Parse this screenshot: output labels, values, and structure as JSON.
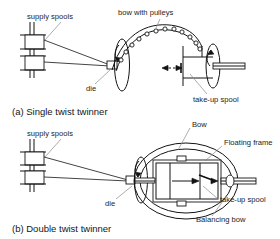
{
  "figure": {
    "panels": [
      {
        "id": "panel-a",
        "caption": "(a) Single twist twinner",
        "labels": {
          "supply_spools": "supply spools",
          "die": "die",
          "bow_with_pulleys": "bow with pulleys",
          "take_up_spool": "take-up spool"
        }
      },
      {
        "id": "panel-b",
        "caption": "(b) Double twist twinner",
        "labels": {
          "supply_spools": "supply spools",
          "die": "die",
          "bow": "Bow",
          "floating_frame": "Floating frame",
          "take_up_spool": "take-up spool",
          "balancing_bow": "Balancing bow"
        }
      }
    ],
    "colors": {
      "line": "#141414",
      "leader": "#8a8a8a",
      "fill": "#ffffff",
      "background": "#ffffff"
    }
  }
}
